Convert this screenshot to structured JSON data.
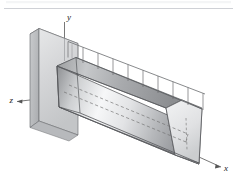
{
  "figure": {
    "axes": {
      "y_label": "y",
      "z_label": "z",
      "x_label": "x"
    },
    "colors": {
      "outline": "#4a4a4a",
      "hidden_line": "#6e6e6e",
      "axis_line": "#555555",
      "wall_front": "#d9dadb",
      "wall_side": "#bcbec0",
      "wall_top": "#eceded",
      "beam_top": "#b9bbbd",
      "beam_front_light": "#f4f5f6",
      "beam_front_dark": "#8e9093",
      "beam_end": "#e3e4e5",
      "beam_under": "#a0a2a5",
      "load_fill": "#fbfbfc",
      "header_rule": "#c9ccd1",
      "background": "#ffffff"
    },
    "load_bar_count": 9,
    "header_rule_present": true
  }
}
